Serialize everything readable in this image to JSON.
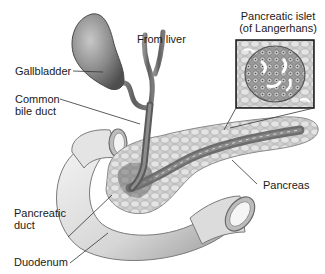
{
  "diagram": {
    "labels": {
      "gallbladder": "Gallbladder",
      "from_liver": "From liver",
      "common_bile_duct_line1": "Common",
      "common_bile_duct_line2": "bile duct",
      "pancreatic_islet_line1": "Pancreatic islet",
      "pancreatic_islet_line2": "(of Langerhans)",
      "pancreas": "Pancreas",
      "pancreatic_duct_line1": "Pancreatic",
      "pancreatic_duct_line2": "duct",
      "duodenum": "Duodenum"
    },
    "inset": {
      "title": "Pancreatic islet (of Langerhans)",
      "description": "Magnified microscopic view of islet cells"
    },
    "colors": {
      "background": "#ffffff",
      "tissue_light": "#e6e6e6",
      "tissue_mid": "#b5b5b5",
      "tissue_dark": "#5a5a5a",
      "leader_line": "#333333",
      "text": "#1a1a1a"
    }
  }
}
